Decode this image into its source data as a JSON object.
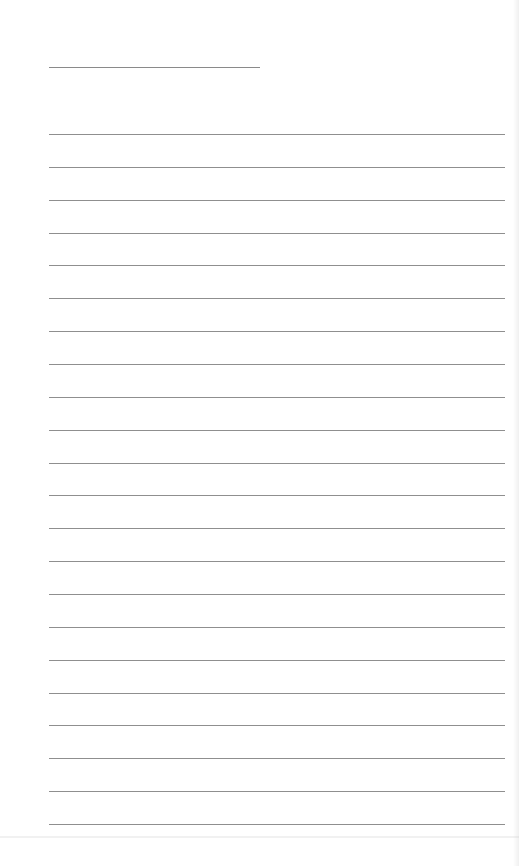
{
  "document": {
    "type": "lined-paper",
    "title_text": "",
    "title_line": {
      "x": 49,
      "y": 67,
      "width": 211
    },
    "rules": {
      "count": 22,
      "first_y": 134,
      "last_y": 824,
      "left_x": 49,
      "right_x": 505,
      "color": "#8f8f8f"
    },
    "lines_text": [
      "",
      "",
      "",
      "",
      "",
      "",
      "",
      "",
      "",
      "",
      "",
      "",
      "",
      "",
      "",
      "",
      "",
      "",
      "",
      "",
      "",
      ""
    ]
  }
}
